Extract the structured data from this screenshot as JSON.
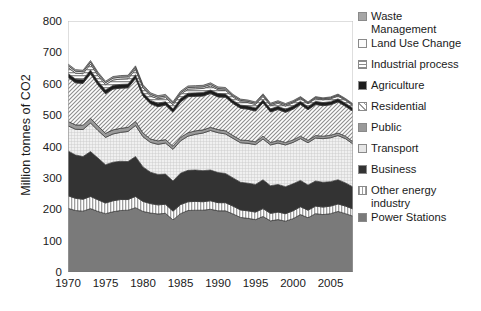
{
  "chart_data": {
    "type": "area",
    "title": "",
    "xlabel": "",
    "ylabel": "Million tonnes of CO2",
    "xlim": [
      1970,
      2008
    ],
    "ylim": [
      0,
      800
    ],
    "yticks": [
      0,
      100,
      200,
      300,
      400,
      500,
      600,
      700,
      800
    ],
    "xticks": [
      1970,
      1975,
      1980,
      1985,
      1990,
      1995,
      2000,
      2005
    ],
    "grid": false,
    "legend_position": "right",
    "stacked": true,
    "x": [
      1970,
      1971,
      1972,
      1973,
      1974,
      1975,
      1976,
      1977,
      1978,
      1979,
      1980,
      1981,
      1982,
      1983,
      1984,
      1985,
      1986,
      1987,
      1988,
      1989,
      1990,
      1991,
      1992,
      1993,
      1994,
      1995,
      1996,
      1997,
      1998,
      1999,
      2000,
      2001,
      2002,
      2003,
      2004,
      2005,
      2006,
      2007,
      2008
    ],
    "series": [
      {
        "name": "Power Stations",
        "color": "#7a7a7a",
        "pattern": "solid",
        "values": [
          203,
          196,
          194,
          202,
          193,
          186,
          192,
          196,
          197,
          205,
          193,
          188,
          185,
          187,
          166,
          186,
          196,
          197,
          197,
          200,
          195,
          195,
          185,
          174,
          171,
          167,
          177,
          163,
          167,
          162,
          170,
          183,
          173,
          186,
          183,
          186,
          193,
          186,
          178
        ]
      },
      {
        "name": "Other energy industry",
        "color": "#d9d9d9",
        "pattern": "vertical",
        "values": [
          40,
          39,
          38,
          39,
          37,
          34,
          35,
          35,
          34,
          36,
          32,
          30,
          29,
          29,
          28,
          29,
          28,
          28,
          27,
          27,
          26,
          26,
          25,
          24,
          24,
          24,
          25,
          24,
          24,
          24,
          25,
          25,
          24,
          24,
          24,
          24,
          24,
          24,
          23
        ]
      },
      {
        "name": "Business",
        "color": "#333333",
        "pattern": "solid",
        "values": [
          143,
          138,
          136,
          143,
          133,
          122,
          123,
          122,
          121,
          127,
          110,
          100,
          97,
          96,
          96,
          100,
          100,
          100,
          99,
          98,
          96,
          93,
          90,
          88,
          88,
          88,
          92,
          88,
          88,
          86,
          86,
          84,
          80,
          80,
          79,
          78,
          77,
          74,
          70
        ]
      },
      {
        "name": "Transport",
        "color": "#e2e2e2",
        "pattern": "cross",
        "values": [
          80,
          82,
          86,
          91,
          88,
          87,
          90,
          92,
          96,
          99,
          96,
          95,
          96,
          99,
          101,
          103,
          109,
          114,
          120,
          126,
          127,
          126,
          126,
          126,
          127,
          127,
          130,
          130,
          132,
          133,
          132,
          133,
          135,
          137,
          139,
          140,
          141,
          141,
          137
        ]
      },
      {
        "name": "Public",
        "color": "#9a9a9a",
        "pattern": "solid",
        "values": [
          14,
          14,
          14,
          15,
          14,
          13,
          13,
          13,
          13,
          13,
          12,
          11,
          11,
          11,
          10,
          11,
          11,
          11,
          10,
          10,
          10,
          10,
          9,
          9,
          9,
          9,
          9,
          8,
          8,
          8,
          8,
          8,
          8,
          8,
          8,
          8,
          8,
          8,
          7
        ]
      },
      {
        "name": "Residential",
        "color": "#c8c8c8",
        "pattern": "diagonal",
        "values": [
          141,
          134,
          133,
          142,
          131,
          126,
          130,
          128,
          126,
          137,
          118,
          112,
          109,
          110,
          108,
          113,
          115,
          110,
          108,
          108,
          104,
          107,
          102,
          101,
          100,
          98,
          106,
          97,
          99,
          96,
          98,
          101,
          97,
          99,
          97,
          97,
          99,
          95,
          97
        ]
      },
      {
        "name": "Agriculture",
        "color": "#1c1c1c",
        "pattern": "solid",
        "values": [
          12,
          12,
          12,
          12,
          12,
          12,
          12,
          12,
          12,
          12,
          11,
          11,
          11,
          11,
          11,
          11,
          11,
          11,
          11,
          11,
          11,
          10,
          10,
          10,
          10,
          10,
          10,
          10,
          10,
          10,
          10,
          10,
          10,
          10,
          10,
          10,
          10,
          10,
          10
        ]
      },
      {
        "name": "Industrial process",
        "color": "#b4b4b4",
        "pattern": "horizontal",
        "values": [
          19,
          19,
          19,
          19,
          18,
          17,
          17,
          17,
          17,
          17,
          15,
          14,
          14,
          13,
          13,
          13,
          13,
          13,
          13,
          13,
          12,
          12,
          11,
          11,
          11,
          11,
          11,
          10,
          10,
          10,
          10,
          9,
          9,
          9,
          9,
          9,
          9,
          9,
          8
        ]
      },
      {
        "name": "Land Use Change",
        "color": "#f2f2f2",
        "pattern": "solid",
        "values": [
          6,
          6,
          6,
          6,
          6,
          6,
          6,
          6,
          6,
          6,
          5,
          5,
          5,
          5,
          5,
          5,
          5,
          5,
          5,
          5,
          4,
          4,
          4,
          4,
          4,
          4,
          4,
          4,
          4,
          4,
          3,
          3,
          3,
          3,
          3,
          3,
          3,
          3,
          3
        ]
      },
      {
        "name": "Waste Management",
        "color": "#a6a6a6",
        "pattern": "solid",
        "values": [
          5,
          5,
          5,
          5,
          5,
          5,
          5,
          5,
          5,
          5,
          5,
          5,
          5,
          5,
          5,
          5,
          5,
          5,
          5,
          5,
          5,
          5,
          4,
          4,
          4,
          4,
          4,
          4,
          4,
          4,
          4,
          3,
          3,
          3,
          3,
          3,
          3,
          3,
          3
        ]
      }
    ],
    "totals": [
      663,
      645,
      643,
      674,
      637,
      608,
      623,
      626,
      627,
      657,
      597,
      571,
      562,
      565,
      541,
      576,
      593,
      596,
      593,
      598,
      590,
      588,
      566,
      551,
      548,
      542,
      568,
      538,
      546,
      537,
      546,
      559,
      542,
      559,
      555,
      558,
      567,
      553,
      536
    ]
  },
  "legend": {
    "items": [
      {
        "label": "Waste",
        "label2": "Management",
        "swatch": "waste-management-swatch"
      },
      {
        "label": "Land Use Change",
        "swatch": "land-use-change-swatch"
      },
      {
        "label": "Industrial process",
        "swatch": "industrial-process-swatch"
      },
      {
        "label": "Agriculture",
        "swatch": "agriculture-swatch"
      },
      {
        "label": "Residential",
        "swatch": "residential-swatch"
      },
      {
        "label": "Public",
        "swatch": "public-swatch"
      },
      {
        "label": "Transport",
        "swatch": "transport-swatch"
      },
      {
        "label": "Business",
        "swatch": "business-swatch"
      },
      {
        "label": "Other energy",
        "label2": "industry",
        "swatch": "other-energy-industry-swatch"
      },
      {
        "label": "Power Stations",
        "swatch": "power-stations-swatch"
      }
    ]
  }
}
